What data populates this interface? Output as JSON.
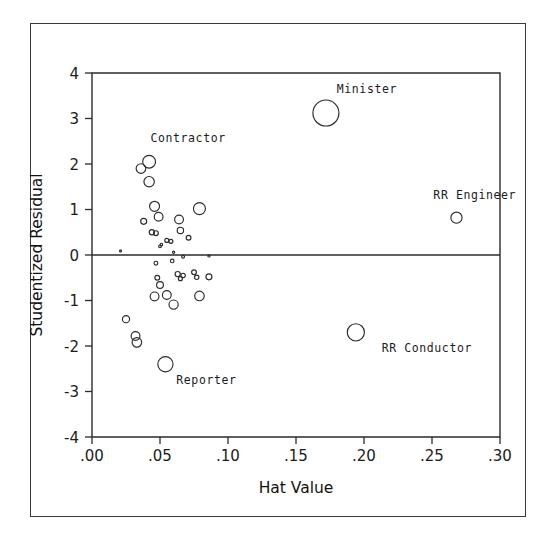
{
  "figure": {
    "background_color": "#ffffff",
    "frame_color": "#3a3a3a",
    "ink_color": "#2b2b2b"
  },
  "chart_data": {
    "type": "scatter",
    "title": "",
    "subtitle": "",
    "xlabel": "Hat Value",
    "ylabel": "Studentized Residual",
    "xlim": [
      0.0,
      0.3
    ],
    "ylim": [
      -4,
      4
    ],
    "xticks": [
      0.0,
      0.05,
      0.1,
      0.15,
      0.2,
      0.25,
      0.3
    ],
    "xticklabels": [
      ".00",
      ".05",
      ".10",
      ".15",
      ".20",
      ".25",
      ".30"
    ],
    "yticks": [
      4,
      3,
      2,
      1,
      0,
      -1,
      -2,
      -3,
      -4
    ],
    "yticklabels": [
      "4",
      "3",
      "2",
      "1",
      "0",
      "-1",
      "-2",
      "-3",
      "-4"
    ],
    "grid": false,
    "legend": null,
    "reference_lines": [
      {
        "axis": "y",
        "value": 0
      }
    ],
    "marker_style": "open-circle",
    "marker_size_encodes": "Cook's D influence",
    "annotations": [
      {
        "text": "Minister",
        "x": 0.172,
        "y": 3.12,
        "label_x": 0.18,
        "label_y": 3.55
      },
      {
        "text": "Contractor",
        "x": 0.042,
        "y": 2.05,
        "label_x": 0.043,
        "label_y": 2.48
      },
      {
        "text": "RR Engineer",
        "x": 0.268,
        "y": 0.82,
        "label_x": 0.251,
        "label_y": 1.22
      },
      {
        "text": "RR Conductor",
        "x": 0.194,
        "y": -1.7,
        "label_x": 0.213,
        "label_y": -2.13
      },
      {
        "text": "Reporter",
        "x": 0.054,
        "y": -2.4,
        "label_x": 0.062,
        "label_y": -2.84
      }
    ],
    "points": [
      {
        "x": 0.172,
        "y": 3.12,
        "r": 13.0,
        "label": "Minister"
      },
      {
        "x": 0.042,
        "y": 2.05,
        "r": 6.4,
        "label": "Contractor"
      },
      {
        "x": 0.036,
        "y": 1.9,
        "r": 4.8,
        "label": ""
      },
      {
        "x": 0.042,
        "y": 1.61,
        "r": 5.2,
        "label": ""
      },
      {
        "x": 0.268,
        "y": 0.82,
        "r": 5.6,
        "label": "RR Engineer"
      },
      {
        "x": 0.079,
        "y": 1.02,
        "r": 6.0,
        "label": ""
      },
      {
        "x": 0.046,
        "y": 1.07,
        "r": 5.0,
        "label": ""
      },
      {
        "x": 0.049,
        "y": 0.84,
        "r": 4.4,
        "label": ""
      },
      {
        "x": 0.064,
        "y": 0.78,
        "r": 4.4,
        "label": ""
      },
      {
        "x": 0.038,
        "y": 0.74,
        "r": 3.0,
        "label": ""
      },
      {
        "x": 0.065,
        "y": 0.54,
        "r": 3.2,
        "label": ""
      },
      {
        "x": 0.044,
        "y": 0.5,
        "r": 2.6,
        "label": ""
      },
      {
        "x": 0.047,
        "y": 0.48,
        "r": 2.4,
        "label": ""
      },
      {
        "x": 0.071,
        "y": 0.38,
        "r": 2.4,
        "label": ""
      },
      {
        "x": 0.055,
        "y": 0.32,
        "r": 2.0,
        "label": ""
      },
      {
        "x": 0.058,
        "y": 0.3,
        "r": 2.0,
        "label": ""
      },
      {
        "x": 0.05,
        "y": 0.19,
        "r": 1.4,
        "label": ""
      },
      {
        "x": 0.051,
        "y": 0.23,
        "r": 1.3,
        "label": ""
      },
      {
        "x": 0.021,
        "y": 0.09,
        "r": 1.0,
        "label": ""
      },
      {
        "x": 0.06,
        "y": 0.06,
        "r": 1.1,
        "label": ""
      },
      {
        "x": 0.067,
        "y": -0.04,
        "r": 1.4,
        "label": ""
      },
      {
        "x": 0.086,
        "y": -0.02,
        "r": 1.1,
        "label": ""
      },
      {
        "x": 0.047,
        "y": -0.18,
        "r": 1.9,
        "label": ""
      },
      {
        "x": 0.059,
        "y": -0.13,
        "r": 1.8,
        "label": ""
      },
      {
        "x": 0.063,
        "y": -0.42,
        "r": 2.6,
        "label": ""
      },
      {
        "x": 0.067,
        "y": -0.45,
        "r": 2.2,
        "label": ""
      },
      {
        "x": 0.065,
        "y": -0.52,
        "r": 2.0,
        "label": ""
      },
      {
        "x": 0.075,
        "y": -0.38,
        "r": 2.4,
        "label": ""
      },
      {
        "x": 0.077,
        "y": -0.49,
        "r": 2.2,
        "label": ""
      },
      {
        "x": 0.048,
        "y": -0.5,
        "r": 2.4,
        "label": ""
      },
      {
        "x": 0.086,
        "y": -0.48,
        "r": 3.0,
        "label": ""
      },
      {
        "x": 0.05,
        "y": -0.66,
        "r": 3.4,
        "label": ""
      },
      {
        "x": 0.046,
        "y": -0.91,
        "r": 4.4,
        "label": ""
      },
      {
        "x": 0.055,
        "y": -0.88,
        "r": 4.4,
        "label": ""
      },
      {
        "x": 0.079,
        "y": -0.9,
        "r": 4.8,
        "label": ""
      },
      {
        "x": 0.06,
        "y": -1.09,
        "r": 4.6,
        "label": ""
      },
      {
        "x": 0.025,
        "y": -1.41,
        "r": 3.6,
        "label": ""
      },
      {
        "x": 0.032,
        "y": -1.78,
        "r": 4.4,
        "label": ""
      },
      {
        "x": 0.033,
        "y": -1.92,
        "r": 4.8,
        "label": ""
      },
      {
        "x": 0.054,
        "y": -2.4,
        "r": 7.6,
        "label": "Reporter"
      },
      {
        "x": 0.194,
        "y": -1.7,
        "r": 8.6,
        "label": "RR Conductor"
      }
    ]
  }
}
